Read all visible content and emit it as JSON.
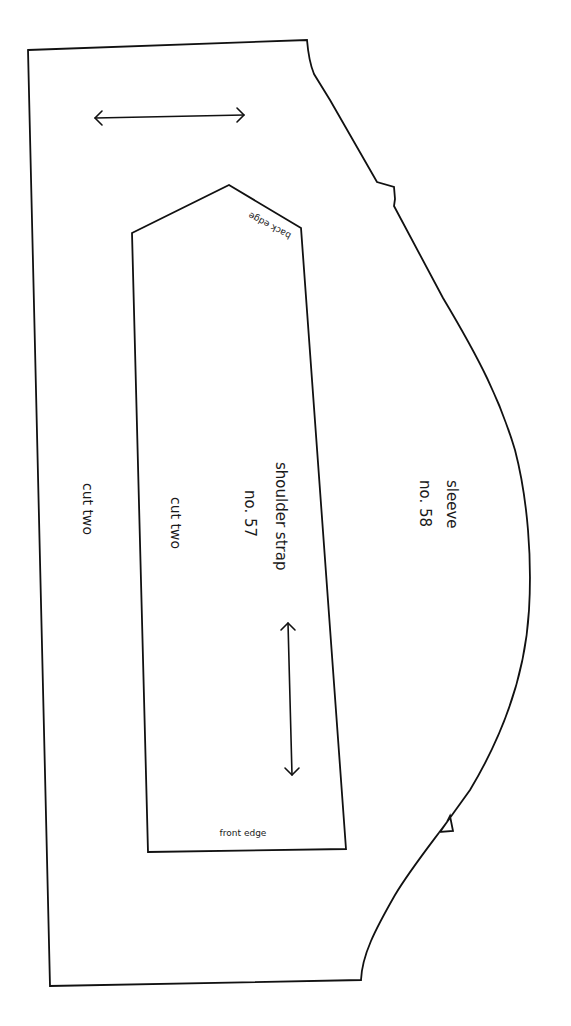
{
  "document": {
    "type": "sewing-pattern-sheet",
    "background_color": "#ffffff",
    "line_color": "#111111"
  },
  "pieces": {
    "sleeve": {
      "name": "sleeve",
      "number": "no. 58",
      "instruction": "cut two"
    },
    "shoulder_strap": {
      "name": "shoulder strap",
      "number": "no. 57",
      "instruction": "cut two",
      "top_edge_label": "back edge",
      "bottom_edge_label": "front edge"
    }
  },
  "markers": {
    "sleeve_grainline": "grainline-arrow-horizontal",
    "strap_grainline": "grainline-arrow-vertical"
  }
}
